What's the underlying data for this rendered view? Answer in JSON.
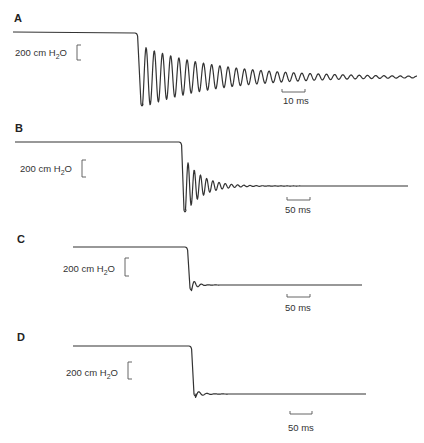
{
  "chart_data": [
    {
      "type": "line",
      "panel": "A",
      "title": "A",
      "ylabel_scale": "200 cm H2O",
      "xlabel_scale": "10 ms",
      "trace": {
        "start": [
          13,
          32
        ],
        "corner": [
          137,
          33
        ],
        "end_x": 417,
        "settle_y": 77,
        "first_min": [
          142,
          108
        ],
        "osc_amplitude": 32,
        "osc_period": 8.2,
        "osc_decay": 0.013,
        "fall_width": 5
      },
      "pressure_bar": {
        "x": 77,
        "y1": 45,
        "y2": 60
      },
      "label_pos": {
        "x": 15,
        "y": 56
      },
      "time_bar": {
        "x1": 282,
        "x2": 305,
        "y": 92
      },
      "time_label_pos": {
        "x": 283,
        "y": 104
      },
      "letter_pos": {
        "x": 14,
        "y": 22
      }
    },
    {
      "type": "line",
      "panel": "B",
      "title": "B",
      "ylabel_scale": "200 cm H2O",
      "xlabel_scale": "50 ms",
      "trace": {
        "start": [
          15,
          142
        ],
        "corner": [
          181,
          142
        ],
        "end_x": 408,
        "settle_y": 186,
        "first_min": [
          185,
          214
        ],
        "osc_amplitude": 28,
        "osc_period": 6.2,
        "osc_decay": 0.06,
        "fall_width": 4
      },
      "pressure_bar": {
        "x": 82,
        "y1": 160,
        "y2": 177
      },
      "label_pos": {
        "x": 20,
        "y": 172
      },
      "time_bar": {
        "x1": 287,
        "x2": 310,
        "y": 200
      },
      "time_label_pos": {
        "x": 285,
        "y": 213
      },
      "letter_pos": {
        "x": 15,
        "y": 132
      }
    },
    {
      "type": "line",
      "panel": "C",
      "title": "C",
      "ylabel_scale": "200 cm H2O",
      "xlabel_scale": "50 ms",
      "trace": {
        "start": [
          73,
          247
        ],
        "corner": [
          187,
          247
        ],
        "end_x": 362,
        "settle_y": 285,
        "first_min": [
          191,
          292
        ],
        "osc_amplitude": 8,
        "osc_period": 7,
        "osc_decay": 0.2,
        "fall_width": 4
      },
      "pressure_bar": {
        "x": 125,
        "y1": 258,
        "y2": 276
      },
      "label_pos": {
        "x": 63,
        "y": 272
      },
      "time_bar": {
        "x1": 287,
        "x2": 310,
        "y": 297
      },
      "time_label_pos": {
        "x": 285,
        "y": 311
      },
      "letter_pos": {
        "x": 17,
        "y": 243
      }
    },
    {
      "type": "line",
      "panel": "D",
      "title": "D",
      "ylabel_scale": "200 cm H2O",
      "xlabel_scale": "50 ms",
      "trace": {
        "start": [
          73,
          346
        ],
        "corner": [
          191,
          346
        ],
        "end_x": 366,
        "settle_y": 394,
        "first_min": [
          195,
          398
        ],
        "osc_amplitude": 2,
        "osc_period": 8,
        "osc_decay": 0.15,
        "fall_width": 5
      },
      "pressure_bar": {
        "x": 128,
        "y1": 362,
        "y2": 379
      },
      "label_pos": {
        "x": 66,
        "y": 376
      },
      "time_bar": {
        "x1": 290,
        "x2": 312,
        "y": 414
      },
      "time_label_pos": {
        "x": 288,
        "y": 431
      },
      "letter_pos": {
        "x": 17,
        "y": 341
      }
    }
  ],
  "panels": [
    {
      "letter": "A",
      "pressure_scale": "200 cm H",
      "pressure_sub": "2",
      "pressure_unit_tail": "O",
      "time_scale": "10 ms"
    },
    {
      "letter": "B",
      "pressure_scale": "200 cm H",
      "pressure_sub": "2",
      "pressure_unit_tail": "O",
      "time_scale": "50 ms"
    },
    {
      "letter": "C",
      "pressure_scale": "200 cm H",
      "pressure_sub": "2",
      "pressure_unit_tail": "O",
      "time_scale": "50 ms"
    },
    {
      "letter": "D",
      "pressure_scale": "200 cm H",
      "pressure_sub": "2",
      "pressure_unit_tail": "O",
      "time_scale": "50 ms"
    }
  ],
  "colors": {
    "trace": "#333333",
    "text": "#2a2a2a",
    "background": "#ffffff"
  }
}
